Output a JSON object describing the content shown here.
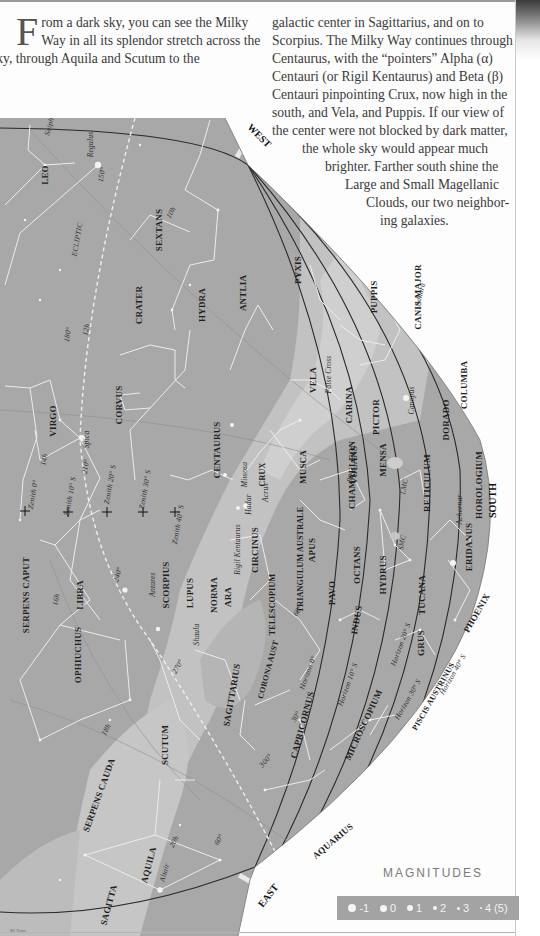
{
  "page": {
    "intro_dropcap": "F",
    "intro_lines": [
      "rom a dark sky, you can see the Milky",
      "Way in all its splendor stretch across the",
      "sky, through Aquila and Scutum to the"
    ],
    "right_lines": [
      "galactic center in Sagittarius, and on to",
      "Scorpius. The Milky Way continues through",
      "Centaurus, with the “pointers” Alpha (α)",
      "Centauri (or Rigil Kentaurus) and Beta (β)",
      "Centauri pinpointing Crux, now high in the",
      "south, and Vela, and Puppis. If our view of",
      "the center were not blocked by dark matter,",
      "the whole sky would appear much",
      "brighter. Farther south shine the",
      "Large and Small Magellanic",
      "Clouds, our two neighbor-",
      "ing galaxies."
    ],
    "credit": "WI Tirion"
  },
  "map": {
    "colors": {
      "sky": "#a8a8a8",
      "milky_way": "#c4c4c4",
      "milky_way_bright": "#d0d0d0",
      "horizon_lines": "#2a2a2a",
      "constellation_lines": "#ececec"
    },
    "directions": {
      "west": "WEST",
      "east": "EAST",
      "south": "SOUTH"
    },
    "constellations": [
      "LEO",
      "SEXTANS",
      "CRATER",
      "HYDRA",
      "ANTLIA",
      "PYXIS",
      "VELA",
      "PUPPIS",
      "CANIS MAJOR",
      "COLUMBA",
      "DORADO",
      "PICTOR",
      "CARINA",
      "MENSA",
      "VOLANS",
      "CHAMAELEON",
      "MUSCA",
      "CRUX",
      "CENTAURUS",
      "CORVUS",
      "VIRGO",
      "LIBRA",
      "LUPUS",
      "NORMA",
      "CIRCINUS",
      "TRIANGULUM AUSTRALE",
      "APUS",
      "OCTANS",
      "HYDRUS",
      "RETICULUM",
      "HOROLOGIUM",
      "ERIDANUS",
      "TUCANA",
      "PHOENIX",
      "GRUS",
      "INDUS",
      "PAVO",
      "ARA",
      "TELESCOPIUM",
      "CORONA AUST",
      "SAGITTARIUS",
      "SCORPIUS",
      "OPHIUCHUS",
      "SERPENS CAPUT",
      "SERPENS CAUDA",
      "SCUTUM",
      "AQUILA",
      "SAGITTA",
      "CAPRICORNUS",
      "MICROSCOPIUM",
      "PISCIS AUSTRINUS",
      "AQUARIUS"
    ],
    "stars": [
      "Regulus",
      "Spica",
      "Antares",
      "Shaula",
      "Altair",
      "Rigil Kentaurus",
      "Hadar",
      "Mimosa",
      "Acrux",
      "Canopus",
      "Adhara",
      "Achernar",
      "False Cross"
    ],
    "misc_labels": [
      "ECLIPTIC",
      "LMC",
      "SMC",
      "Saiph"
    ],
    "zenith_labels": [
      "Zenith 0°",
      "Zenith 10° S",
      "Zenith 20° S",
      "Zenith 30° S",
      "Zenith 40° S"
    ],
    "horizon_labels": [
      "Horizon 0°",
      "Horizon 10° S",
      "Horizon 20° S",
      "Horizon 30° S",
      "Horizon 40° S"
    ],
    "ra_labels": [
      "150°",
      "180°",
      "210°",
      "240°",
      "270°",
      "300°"
    ],
    "hour_labels": [
      "10h",
      "12h",
      "14h",
      "16h",
      "18h",
      "20h",
      "60°",
      "90°",
      "30°",
      "60°"
    ]
  },
  "magnitudes": {
    "title": "MAGNITUDES",
    "items": [
      {
        "label": "-1",
        "size": 8
      },
      {
        "label": "0",
        "size": 7
      },
      {
        "label": "1",
        "size": 6
      },
      {
        "label": "2",
        "size": 5
      },
      {
        "label": "3",
        "size": 4
      },
      {
        "label": "4 (5)",
        "size": 3
      }
    ]
  }
}
